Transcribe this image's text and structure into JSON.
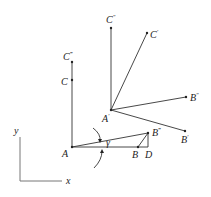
{
  "figure": {
    "points": {
      "A": {
        "label": "A",
        "prime": ""
      },
      "B": {
        "label": "B",
        "prime": ""
      },
      "C": {
        "label": "C",
        "prime": ""
      },
      "D": {
        "label": "D",
        "prime": ""
      },
      "A1": {
        "label": "A",
        "prime": "′"
      },
      "B1": {
        "label": "B",
        "prime": "′"
      },
      "C1": {
        "label": "C",
        "prime": "′"
      },
      "B2": {
        "label": "B",
        "prime": "″"
      },
      "C2": {
        "label": "C",
        "prime": "″"
      },
      "B3": {
        "label": "B",
        "prime": "‴"
      },
      "C3": {
        "label": "C",
        "prime": "‴"
      }
    },
    "angle_label": "γ",
    "axes": {
      "x_label": "x",
      "y_label": "y"
    },
    "colors": {
      "line": "#333333",
      "axis": "#777777",
      "text": "#222222"
    }
  }
}
